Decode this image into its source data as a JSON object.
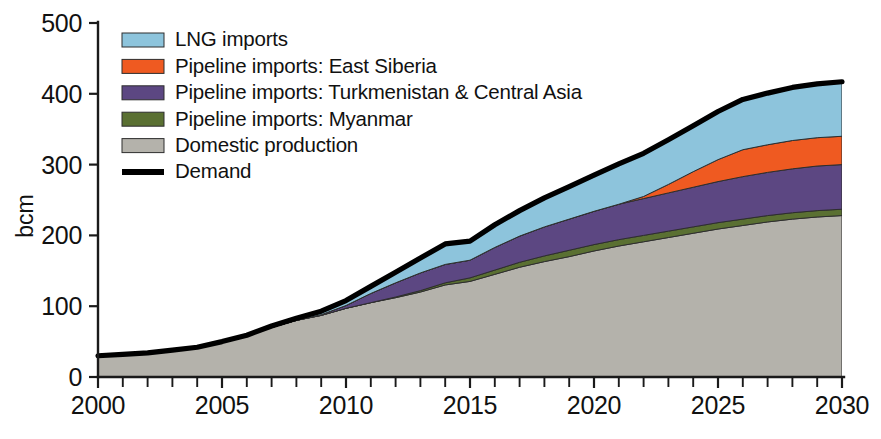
{
  "chart_data": {
    "type": "area",
    "title": "",
    "xlabel": "",
    "ylabel": "bcm",
    "xlim": [
      2000,
      2030
    ],
    "ylim": [
      0,
      500
    ],
    "ytick_values": [
      0,
      100,
      200,
      300,
      400,
      500
    ],
    "ytick_labels": [
      "0",
      "100",
      "200",
      "300",
      "400",
      "500"
    ],
    "xtick_values": [
      2000,
      2005,
      2010,
      2015,
      2020,
      2025,
      2030
    ],
    "xtick_labels": [
      "2000",
      "2005",
      "2010",
      "2015",
      "2020",
      "2025",
      "2030"
    ],
    "x_minor_tick_interval": 1,
    "grid": false,
    "legend_position": "upper-left-inside",
    "stacked": true,
    "stack_order_bottom_to_top": [
      "Domestic production",
      "Pipeline imports: Myanmar",
      "Pipeline imports: Turkmenistan & Central Asia",
      "Pipeline imports: East Siberia",
      "LNG imports"
    ],
    "x": [
      2000,
      2001,
      2002,
      2003,
      2004,
      2005,
      2006,
      2007,
      2008,
      2009,
      2010,
      2011,
      2012,
      2013,
      2014,
      2015,
      2016,
      2017,
      2018,
      2019,
      2020,
      2021,
      2022,
      2023,
      2024,
      2025,
      2026,
      2027,
      2028,
      2029,
      2030
    ],
    "series": [
      {
        "name": "Domestic production",
        "color": "#b4b2ab",
        "values": [
          30,
          32,
          34,
          38,
          42,
          50,
          58,
          70,
          80,
          87,
          97,
          105,
          112,
          120,
          130,
          135,
          145,
          155,
          163,
          170,
          178,
          185,
          191,
          197,
          203,
          209,
          214,
          219,
          223,
          226,
          228
        ]
      },
      {
        "name": "Pipeline imports: Myanmar",
        "color": "#5a7032",
        "values": [
          0,
          0,
          0,
          0,
          0,
          0,
          0,
          0,
          0,
          0,
          0,
          0,
          1,
          2,
          3,
          5,
          6,
          7,
          8,
          9,
          9,
          9,
          9,
          9,
          9,
          9,
          9,
          9,
          9,
          9,
          9
        ]
      },
      {
        "name": "Pipeline imports: Turkmenistan & Central Asia",
        "color": "#5c4782",
        "values": [
          0,
          0,
          0,
          0,
          0,
          0,
          0,
          0,
          0,
          1,
          4,
          13,
          20,
          25,
          26,
          25,
          32,
          37,
          41,
          44,
          47,
          50,
          52,
          54,
          56,
          58,
          60,
          61,
          62,
          63,
          63
        ]
      },
      {
        "name": "Pipeline imports: East Siberia",
        "color": "#ef5a21",
        "values": [
          0,
          0,
          0,
          0,
          0,
          0,
          0,
          0,
          0,
          0,
          0,
          0,
          0,
          0,
          0,
          0,
          0,
          0,
          0,
          0,
          0,
          0,
          3,
          12,
          22,
          31,
          38,
          39,
          40,
          40,
          40
        ]
      },
      {
        "name": "LNG imports",
        "color": "#8dc4dc",
        "values": [
          0,
          0,
          0,
          0,
          0,
          0,
          1,
          2,
          3,
          5,
          7,
          10,
          15,
          21,
          29,
          27,
          32,
          36,
          41,
          46,
          51,
          57,
          61,
          63,
          65,
          68,
          71,
          73,
          75,
          76,
          77
        ]
      }
    ],
    "demand": {
      "name": "Demand",
      "color": "#000000",
      "values": [
        30,
        32,
        34,
        38,
        42,
        50,
        59,
        72,
        83,
        93,
        108,
        128,
        148,
        168,
        188,
        192,
        215,
        235,
        253,
        269,
        285,
        301,
        316,
        335,
        355,
        375,
        392,
        401,
        409,
        414,
        417
      ]
    }
  },
  "legend": {
    "items": [
      {
        "label": "LNG imports",
        "color": "#8dc4dc",
        "style": "swatch"
      },
      {
        "label": "Pipeline imports: East Siberia",
        "color": "#ef5a21",
        "style": "swatch"
      },
      {
        "label": "Pipeline imports: Turkmenistan & Central Asia",
        "color": "#5c4782",
        "style": "swatch"
      },
      {
        "label": "Pipeline imports: Myanmar",
        "color": "#5a7032",
        "style": "swatch"
      },
      {
        "label": "Domestic production",
        "color": "#b4b2ab",
        "style": "swatch"
      },
      {
        "label": "Demand",
        "color": "#000000",
        "style": "line"
      }
    ]
  },
  "axes": {
    "y_title": "bcm"
  }
}
